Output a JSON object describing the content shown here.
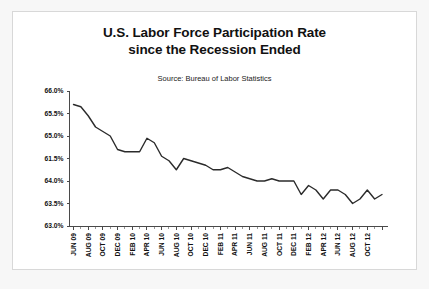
{
  "chart": {
    "title_line1": "U.S. Labor Force Participation Rate",
    "title_line2": "since the Recession Ended",
    "source": "Source: Bureau of Labor Statistics"
  },
  "chart_data": {
    "type": "line",
    "title": "U.S. Labor Force Participation Rate since the Recession Ended",
    "subtitle": "Source: Bureau of Labor Statistics",
    "xlabel": "",
    "ylabel": "",
    "ylim": [
      63.0,
      66.0
    ],
    "ytick_labels": [
      "66.0%",
      "65.5%",
      "65.0%",
      "61.5%",
      "64.0%",
      "63.5%",
      "63.0%"
    ],
    "ytick_values": [
      66.0,
      65.5,
      65.0,
      64.5,
      64.0,
      63.5,
      63.0
    ],
    "grid": false,
    "legend": "none",
    "x_tick_labels": [
      "JUN 09",
      "AUG 09",
      "OCT 09",
      "DEC 09",
      "FEB 10",
      "APR 10",
      "JUN 10",
      "AUG 10",
      "OCT 10",
      "DEC 10",
      "FEB 11",
      "APR 11",
      "JUN 11",
      "AUG 11",
      "OCT 11",
      "DEC 11",
      "FEB 12",
      "APR 12",
      "JUN 12",
      "AUG 12",
      "OCT 12"
    ],
    "x": [
      "JUN 09",
      "JUL 09",
      "AUG 09",
      "SEP 09",
      "OCT 09",
      "NOV 09",
      "DEC 09",
      "JAN 10",
      "FEB 10",
      "MAR 10",
      "APR 10",
      "MAY 10",
      "JUN 10",
      "JUL 10",
      "AUG 10",
      "SEP 10",
      "OCT 10",
      "NOV 10",
      "DEC 10",
      "JAN 11",
      "FEB 11",
      "MAR 11",
      "APR 11",
      "MAY 11",
      "JUN 11",
      "JUL 11",
      "AUG 11",
      "SEP 11",
      "OCT 11",
      "NOV 11",
      "DEC 11",
      "JAN 12",
      "FEB 12",
      "MAR 12",
      "APR 12",
      "MAY 12",
      "JUN 12",
      "JUL 12",
      "AUG 12",
      "SEP 12",
      "OCT 12",
      "NOV 12",
      "DEC 12"
    ],
    "values": [
      65.7,
      65.65,
      65.45,
      65.2,
      65.1,
      65.0,
      64.7,
      64.65,
      64.65,
      64.65,
      64.95,
      64.85,
      64.55,
      64.45,
      64.25,
      64.5,
      64.45,
      64.4,
      64.35,
      64.25,
      64.25,
      64.3,
      64.2,
      64.1,
      64.05,
      64.0,
      64.0,
      64.05,
      64.0,
      64.0,
      64.0,
      63.7,
      63.9,
      63.8,
      63.6,
      63.8,
      63.8,
      63.7,
      63.5,
      63.6,
      63.8,
      63.6,
      63.7
    ]
  }
}
